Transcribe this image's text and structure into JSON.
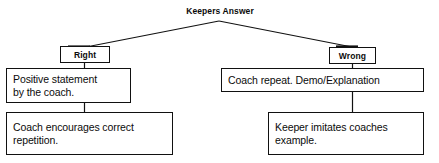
{
  "diagram": {
    "title": "Keepers Answer",
    "type": "flowchart",
    "branches": {
      "left_label": "Right",
      "right_label": "Wrong"
    },
    "nodes": {
      "root": {
        "text": "Keepers Answer",
        "role": "root-title"
      },
      "branch_right": {
        "text": "Right",
        "role": "branch-label"
      },
      "branch_wrong": {
        "text": "Wrong",
        "role": "branch-label"
      },
      "right_step1": {
        "text": "Positive statement\nby the coach.",
        "role": "outcome-step"
      },
      "right_step2": {
        "text": "Coach encourages correct\nrepetition.",
        "role": "outcome-step"
      },
      "wrong_step1": {
        "text": "Coach repeat. Demo/Explanation",
        "role": "outcome-step"
      },
      "wrong_step2": {
        "text": "Keeper imitates coaches\nexample.",
        "role": "outcome-step"
      }
    },
    "colors": {
      "line": "#111111",
      "text": "#0b0b0b",
      "background": "#ffffff"
    }
  }
}
